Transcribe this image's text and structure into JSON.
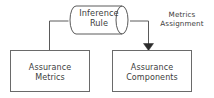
{
  "diagram": {
    "type": "flow-diagram",
    "width": 214,
    "height": 98,
    "background_color": "#ffffff",
    "stroke_color": "#555555",
    "text_color": "#3d3d3d",
    "arrow_fill_color": "#2b2b2b",
    "nodes": [
      {
        "id": "inference-rule",
        "shape": "cylinder",
        "label": "Inference\nRule",
        "x": 68,
        "y": 6,
        "width": 62,
        "height": 28
      },
      {
        "id": "assurance-metrics",
        "shape": "rectangle",
        "label": "Assurance\nMetrics",
        "x": 10,
        "y": 50,
        "width": 80,
        "height": 42
      },
      {
        "id": "assurance-components",
        "shape": "rectangle",
        "label": "Assurance\nComponents",
        "x": 112,
        "y": 50,
        "width": 80,
        "height": 42
      }
    ],
    "edges": [
      {
        "id": "inference-rule-to-assurance-metrics",
        "from": "inference-rule",
        "to": "assurance-metrics",
        "arrowhead": false,
        "label": ""
      },
      {
        "id": "inference-rule-to-assurance-components",
        "from": "inference-rule",
        "to": "assurance-components",
        "arrowhead": true,
        "label": "Metrics\nAssignment"
      }
    ],
    "edge_labels": {
      "metrics_assignment": "Metrics\nAssignment"
    }
  }
}
